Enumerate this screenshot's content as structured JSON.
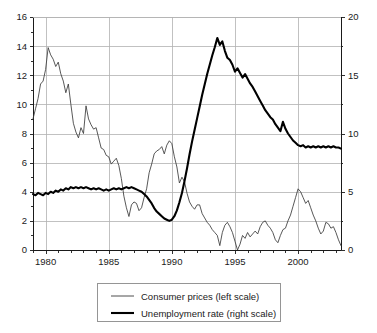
{
  "chart_data": {
    "type": "line",
    "title": "",
    "subtitle": "",
    "xlabel": "",
    "ylabel": "",
    "grid": true,
    "legend_position": "bottom-center",
    "xlim": [
      1979.0,
      2003.4
    ],
    "x_axis": {
      "tick_labels": [
        "1980",
        "1985",
        "1990",
        "1995",
        "2000"
      ],
      "tick_values": [
        1980,
        1985,
        1990,
        1995,
        2000
      ],
      "minor_tick_interval": 1
    },
    "y_axis_left": {
      "label": "Consumer prices (left scale)",
      "ylim": [
        0,
        16
      ],
      "tick_labels": [
        "0",
        "2",
        "4",
        "6",
        "8",
        "10",
        "12",
        "14",
        "16"
      ],
      "tick_values": [
        0,
        2,
        4,
        6,
        8,
        10,
        12,
        14,
        16
      ]
    },
    "y_axis_right": {
      "label": "Unemployment rate (right scale)",
      "ylim": [
        0,
        20
      ],
      "tick_labels": [
        "0",
        "5",
        "10",
        "15",
        "20"
      ],
      "tick_values": [
        0,
        5,
        10,
        15,
        20
      ],
      "minor_tick_interval": 2.5
    },
    "series": [
      {
        "name": "Consumer prices (left scale)",
        "axis": "left",
        "style": "thin-line",
        "color": "#3a3a3a",
        "x": [
          1979.0,
          1979.2,
          1979.4,
          1979.6,
          1979.8,
          1980.0,
          1980.2,
          1980.4,
          1980.6,
          1980.8,
          1981.0,
          1981.2,
          1981.4,
          1981.6,
          1981.8,
          1982.0,
          1982.2,
          1982.4,
          1982.6,
          1982.8,
          1983.0,
          1983.2,
          1983.4,
          1983.6,
          1983.8,
          1984.0,
          1984.2,
          1984.4,
          1984.6,
          1984.8,
          1985.0,
          1985.2,
          1985.4,
          1985.6,
          1985.8,
          1986.0,
          1986.2,
          1986.4,
          1986.6,
          1986.8,
          1987.0,
          1987.2,
          1987.4,
          1987.6,
          1987.8,
          1988.0,
          1988.2,
          1988.4,
          1988.6,
          1988.8,
          1989.0,
          1989.2,
          1989.4,
          1989.6,
          1989.8,
          1990.0,
          1990.2,
          1990.4,
          1990.6,
          1990.8,
          1991.0,
          1991.2,
          1991.4,
          1991.6,
          1991.8,
          1992.0,
          1992.2,
          1992.4,
          1992.6,
          1992.8,
          1993.0,
          1993.2,
          1993.4,
          1993.6,
          1993.8,
          1994.0,
          1994.2,
          1994.4,
          1994.6,
          1994.8,
          1995.0,
          1995.2,
          1995.4,
          1995.6,
          1995.8,
          1996.0,
          1996.2,
          1996.4,
          1996.6,
          1996.8,
          1997.0,
          1997.2,
          1997.4,
          1997.6,
          1997.8,
          1998.0,
          1998.2,
          1998.4,
          1998.6,
          1998.8,
          1999.0,
          1999.2,
          1999.4,
          1999.6,
          1999.8,
          2000.0,
          2000.2,
          2000.4,
          2000.6,
          2000.8,
          2001.0,
          2001.2,
          2001.4,
          2001.6,
          2001.8,
          2002.0,
          2002.2,
          2002.4,
          2002.6,
          2002.8,
          2003.0,
          2003.2,
          2003.4
        ],
        "y": [
          9.0,
          9.7,
          10.4,
          11.4,
          11.6,
          12.4,
          13.9,
          13.4,
          13.1,
          12.6,
          12.9,
          12.1,
          11.6,
          10.8,
          11.4,
          10.0,
          8.7,
          8.1,
          7.7,
          8.4,
          8.0,
          9.9,
          9.0,
          8.6,
          8.3,
          8.4,
          7.7,
          7.0,
          6.9,
          6.5,
          6.4,
          5.9,
          6.1,
          6.3,
          5.8,
          4.9,
          3.7,
          2.9,
          2.3,
          3.1,
          3.3,
          3.2,
          2.7,
          2.9,
          3.6,
          4.2,
          5.3,
          5.9,
          6.6,
          6.8,
          6.9,
          7.1,
          6.6,
          7.2,
          7.5,
          7.3,
          6.4,
          5.7,
          4.6,
          5.0,
          4.7,
          3.9,
          3.3,
          3.0,
          2.8,
          3.1,
          3.1,
          2.5,
          2.2,
          1.9,
          1.7,
          1.4,
          1.2,
          1.0,
          0.3,
          1.2,
          1.7,
          1.9,
          1.6,
          1.2,
          0.6,
          0.0,
          0.4,
          1.0,
          0.8,
          1.2,
          0.9,
          1.1,
          1.3,
          1.1,
          1.6,
          1.9,
          2.0,
          1.7,
          1.5,
          1.2,
          0.7,
          0.5,
          1.0,
          1.4,
          1.5,
          2.0,
          2.4,
          3.0,
          3.6,
          4.2,
          4.0,
          3.6,
          3.2,
          3.4,
          2.9,
          2.4,
          2.0,
          1.5,
          1.1,
          1.3,
          1.9,
          1.8,
          1.5,
          1.6,
          1.2,
          0.7,
          0.3
        ]
      },
      {
        "name": "Unemployment rate (right scale)",
        "axis": "right",
        "style": "thick-line",
        "color": "#000000",
        "x": [
          1979.0,
          1979.2,
          1979.4,
          1979.6,
          1979.8,
          1980.0,
          1980.2,
          1980.4,
          1980.6,
          1980.8,
          1981.0,
          1981.2,
          1981.4,
          1981.6,
          1981.8,
          1982.0,
          1982.2,
          1982.4,
          1982.6,
          1982.8,
          1983.0,
          1983.2,
          1983.4,
          1983.6,
          1983.8,
          1984.0,
          1984.2,
          1984.4,
          1984.6,
          1984.8,
          1985.0,
          1985.2,
          1985.4,
          1985.6,
          1985.8,
          1986.0,
          1986.2,
          1986.4,
          1986.6,
          1986.8,
          1987.0,
          1987.2,
          1987.4,
          1987.6,
          1987.8,
          1988.0,
          1988.2,
          1988.4,
          1988.6,
          1988.8,
          1989.0,
          1989.2,
          1989.4,
          1989.6,
          1989.8,
          1990.0,
          1990.2,
          1990.4,
          1990.6,
          1990.8,
          1991.0,
          1991.2,
          1991.4,
          1991.6,
          1991.8,
          1992.0,
          1992.2,
          1992.4,
          1992.6,
          1992.8,
          1993.0,
          1993.2,
          1993.4,
          1993.6,
          1993.8,
          1994.0,
          1994.2,
          1994.4,
          1994.6,
          1994.8,
          1995.0,
          1995.2,
          1995.4,
          1995.6,
          1995.8,
          1996.0,
          1996.2,
          1996.4,
          1996.6,
          1996.8,
          1997.0,
          1997.2,
          1997.4,
          1997.6,
          1997.8,
          1998.0,
          1998.2,
          1998.4,
          1998.6,
          1998.8,
          1999.0,
          1999.2,
          1999.4,
          1999.6,
          1999.8,
          2000.0,
          2000.2,
          2000.4,
          2000.6,
          2000.8,
          2001.0,
          2001.2,
          2001.4,
          2001.6,
          2001.8,
          2002.0,
          2002.2,
          2002.4,
          2002.6,
          2002.8,
          2003.0,
          2003.2,
          2003.4
        ],
        "y": [
          4.8,
          4.7,
          4.9,
          4.8,
          4.7,
          4.9,
          4.8,
          5.0,
          4.9,
          5.1,
          5.0,
          5.2,
          5.1,
          5.3,
          5.2,
          5.4,
          5.3,
          5.4,
          5.3,
          5.4,
          5.3,
          5.4,
          5.3,
          5.2,
          5.3,
          5.2,
          5.3,
          5.2,
          5.1,
          5.2,
          5.1,
          5.2,
          5.3,
          5.2,
          5.3,
          5.2,
          5.3,
          5.4,
          5.3,
          5.4,
          5.3,
          5.2,
          5.1,
          5.0,
          4.8,
          4.6,
          4.3,
          4.0,
          3.6,
          3.3,
          3.1,
          2.9,
          2.7,
          2.6,
          2.5,
          2.6,
          2.9,
          3.4,
          4.1,
          4.9,
          5.9,
          7.0,
          8.2,
          9.3,
          10.3,
          11.3,
          12.3,
          13.3,
          14.2,
          15.1,
          15.9,
          16.7,
          17.4,
          18.2,
          17.6,
          17.9,
          17.1,
          16.5,
          16.3,
          15.9,
          15.3,
          15.6,
          15.2,
          14.8,
          15.1,
          14.7,
          14.3,
          14.0,
          13.6,
          13.2,
          12.8,
          12.4,
          12.0,
          11.7,
          11.4,
          11.2,
          10.8,
          10.5,
          10.2,
          11.0,
          10.4,
          10.0,
          9.7,
          9.4,
          9.2,
          9.0,
          8.9,
          9.0,
          8.8,
          8.9,
          8.8,
          8.9,
          8.8,
          8.9,
          8.8,
          8.9,
          8.8,
          8.9,
          8.8,
          8.9,
          8.8,
          8.8,
          8.7
        ]
      }
    ]
  },
  "legend": {
    "items": [
      {
        "label": "Consumer prices (left scale)",
        "style": "thin-line"
      },
      {
        "label": "Unemployment rate (right scale)",
        "style": "thick-line"
      }
    ]
  },
  "colors": {
    "background": "#ffffff",
    "grid": "#b2b2b2",
    "axis": "#1a1a1a",
    "consumer_prices": "#3a3a3a",
    "unemployment_rate": "#000000",
    "legend_border": "#8a8a8a"
  }
}
